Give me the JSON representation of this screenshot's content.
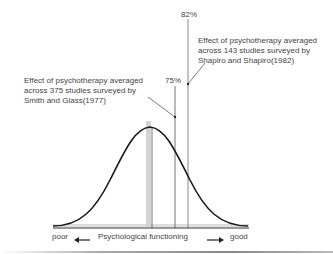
{
  "diagram": {
    "type": "normal-distribution-effect-size",
    "markers": [
      {
        "label": "75%",
        "position_pct": 75
      },
      {
        "label": "82%",
        "position_pct": 82
      }
    ],
    "annotations": [
      {
        "id": "smith-glass",
        "lines": [
          "Effect of psychotherapy averaged",
          "across 375 studies surveyed by",
          "Smith and Glass(1977)"
        ]
      },
      {
        "id": "shapiro",
        "lines": [
          "Effect of psychotherapy averaged",
          "across 143 studies surveyed by",
          "Shapiro and Shapiro(1982)"
        ]
      }
    ],
    "axis": {
      "left": "poor",
      "title": "Psychological functioning",
      "right": "good"
    },
    "colors": {
      "curve": "#1a1a1a",
      "mean_band": "#d0d0d0",
      "lines": "#777777"
    }
  }
}
